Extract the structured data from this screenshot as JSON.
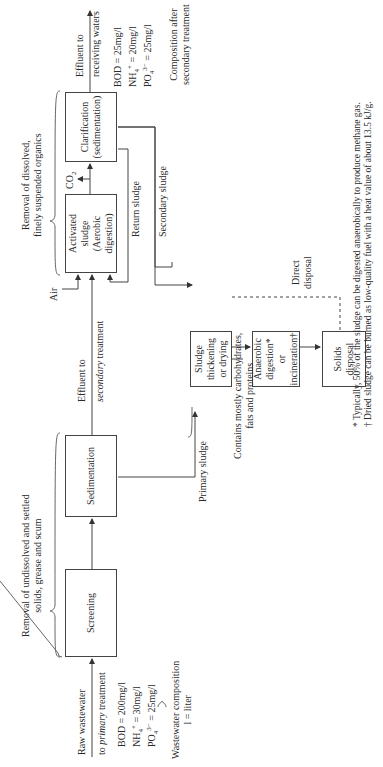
{
  "figure": {
    "orientation": "rotated -90deg (text reads bottom-to-top)",
    "stages": {
      "primary_header": [
        "Removal of undissolved and settled",
        "solids, grease and scum"
      ],
      "secondary_header": [
        "Removal of dissolved,",
        "finely suspended organics"
      ]
    },
    "boxes": {
      "screening": "Screening",
      "sedimentation": "Sedimentation",
      "activated_sludge": [
        "Activated",
        "sludge",
        "(Aerobic digestion)"
      ],
      "clarification": [
        "Clarification",
        "(sedimentation)"
      ],
      "sludge_thickening": [
        "Sludge",
        "thickening",
        "or drying"
      ],
      "anaerobic": [
        "Anaerobic",
        "digestion*",
        "or incineration†"
      ],
      "solids_disposal": [
        "Solids",
        "disposal"
      ]
    },
    "flows": {
      "raw_in_1": "Raw wastewater",
      "raw_in_2_prefix": "to ",
      "raw_in_2_italic": "primary",
      "raw_in_2_suffix": " treatment",
      "effluent_secondary_1": "Effluent to",
      "effluent_secondary_2_italic": "secondary",
      "effluent_secondary_2_suffix": " treatment",
      "air": "Air",
      "co2_main": "CO",
      "co2_sub": "2",
      "return_sludge": "Return sludge",
      "secondary_sludge": "Secondary sludge",
      "primary_sludge": "Primary sludge",
      "direct_disposal": [
        "Direct",
        "disposal"
      ],
      "effluent_receiving": [
        "Effluent to",
        "receiving waters"
      ]
    },
    "raw_composition": {
      "bod": "BOD = 200mg/l",
      "nh4_main": "NH",
      "nh4_sub": "4",
      "nh4_sup": "+",
      "nh4_val": " = 30mg/l",
      "po4_main": "PO",
      "po4_sub": "4",
      "po4_sup": "3−",
      "po4_val": " = 25mg/l",
      "caption": [
        "Wastewater composition",
        "l = liter"
      ]
    },
    "treated_composition": {
      "bod": "BOD = 25mg/l",
      "nh4_main": "NH",
      "nh4_sub": "4",
      "nh4_sup": "+",
      "nh4_val": " = 20mg/l",
      "po4_main": "PO",
      "po4_sub": "4",
      "po4_sup": "3−",
      "po4_val": " = 25mg/l",
      "caption": [
        "Composition after",
        "secondary treatment"
      ]
    },
    "sludge_note": [
      "Contains mostly carbohydrates,",
      "fats and proteins"
    ],
    "footnotes": [
      "* Typically, 50% of the sludge can be digested anaerobically to produce methane gas.",
      "† Dried sludge can be burned as low-quality fuel with a heat value of about 13.5 kJ/g."
    ]
  }
}
